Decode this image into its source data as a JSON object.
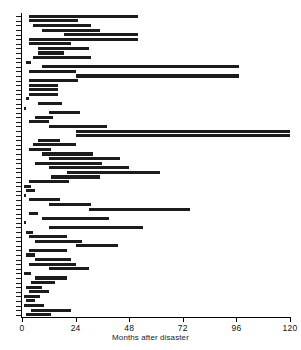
{
  "chart_data": {
    "type": "bar",
    "orientation": "horizontal",
    "subtype": "gantt-interval",
    "title": "",
    "xlabel": "Months after disaster",
    "ylabel": "",
    "xlim": [
      0,
      120
    ],
    "xticks": [
      0,
      24,
      48,
      72,
      96,
      120
    ],
    "xtick_labels": [
      "0",
      "24",
      "48",
      "72",
      "96",
      "120"
    ],
    "grid": false,
    "legend": null,
    "bar_color": "#1c1c1c",
    "n_rows": 66,
    "series": [
      {
        "name": "study-interval",
        "units": "months after disaster",
        "intervals": [
          [
            3,
            52
          ],
          [
            3,
            25
          ],
          [
            5,
            31
          ],
          [
            9,
            35
          ],
          [
            19,
            52
          ],
          [
            3,
            52
          ],
          [
            3,
            22
          ],
          [
            7,
            30
          ],
          [
            7,
            19
          ],
          [
            5,
            31
          ],
          [
            2,
            4
          ],
          [
            9,
            97
          ],
          [
            3,
            24
          ],
          [
            24,
            97
          ],
          [
            3,
            25
          ],
          [
            3,
            16
          ],
          [
            3,
            16
          ],
          [
            3,
            16
          ],
          [
            2,
            3
          ],
          [
            7,
            18
          ],
          [
            1,
            2
          ],
          [
            12,
            26
          ],
          [
            6,
            14
          ],
          [
            3,
            12
          ],
          [
            12,
            38
          ],
          [
            24,
            120
          ],
          [
            24,
            120
          ],
          [
            7,
            17
          ],
          [
            5,
            24
          ],
          [
            3,
            13
          ],
          [
            9,
            32
          ],
          [
            12,
            44
          ],
          [
            6,
            36
          ],
          [
            12,
            48
          ],
          [
            20,
            62
          ],
          [
            13,
            35
          ],
          [
            3,
            21
          ],
          [
            1,
            4
          ],
          [
            2,
            6
          ],
          [
            1,
            2
          ],
          [
            3,
            17
          ],
          [
            12,
            31
          ],
          [
            30,
            75
          ],
          [
            3,
            7
          ],
          [
            9,
            39
          ],
          [
            1,
            2
          ],
          [
            12,
            54
          ],
          [
            2,
            5
          ],
          [
            3,
            20
          ],
          [
            6,
            27
          ],
          [
            24,
            43
          ],
          [
            3,
            20
          ],
          [
            2,
            6
          ],
          [
            6,
            22
          ],
          [
            3,
            24
          ],
          [
            12,
            30
          ],
          [
            1,
            4
          ],
          [
            6,
            20
          ],
          [
            4,
            15
          ],
          [
            2,
            9
          ],
          [
            3,
            12
          ],
          [
            1,
            8
          ],
          [
            2,
            6
          ],
          [
            1,
            10
          ],
          [
            4,
            22
          ],
          [
            2,
            13
          ]
        ]
      }
    ]
  }
}
